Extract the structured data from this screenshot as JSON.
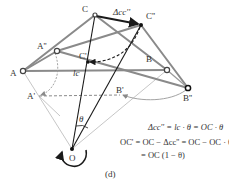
{
  "diagram": {
    "type": "mechanism-linkage",
    "caption": "(d)",
    "points": {
      "A": {
        "label": "A",
        "x": 23,
        "y": 71
      },
      "A2": {
        "label": "A''",
        "x": 57,
        "y": 51
      },
      "A1": {
        "label": "A'",
        "x": 39,
        "y": 96
      },
      "C": {
        "label": "C",
        "x": 95,
        "y": 15
      },
      "C2": {
        "label": "C''",
        "x": 141,
        "y": 25
      },
      "C1": {
        "label": "C'",
        "x": 88,
        "y": 62
      },
      "B": {
        "label": "B",
        "x": 167,
        "y": 70
      },
      "B2": {
        "label": "B''",
        "x": 188,
        "y": 88
      },
      "B1": {
        "label": "B'",
        "x": 120,
        "y": 95
      },
      "O": {
        "label": "O",
        "x": 72,
        "y": 149
      }
    },
    "annotations": {
      "delta_cc": "Δcc''",
      "lc": "lc",
      "theta": "θ"
    },
    "equations": {
      "line1": "Δcc'' = lc · θ = OC · θ",
      "line2": "OC' = OC − Δcc'' = OC − OC · θ",
      "line3": "= OC (1 − θ)"
    },
    "colors": {
      "link_gray": "#8a8a8a",
      "thin_gray": "#b5b5b5",
      "dark": "#1a1a1a",
      "text": "#333333"
    }
  }
}
